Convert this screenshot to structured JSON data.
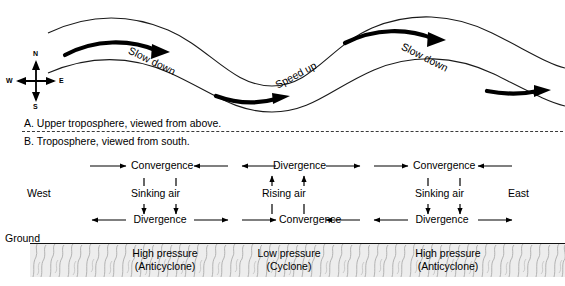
{
  "figure": {
    "panel_a": {
      "caption": "A. Upper troposphere, viewed from above.",
      "compass": {
        "north": "N",
        "south": "S",
        "west": "W",
        "east": "E"
      },
      "wave_labels": [
        {
          "text": "Slow down"
        },
        {
          "text": "Speed up"
        },
        {
          "text": "Slow down"
        }
      ]
    },
    "panel_b": {
      "caption": "B. Troposphere, viewed from south.",
      "west_label": "West",
      "east_label": "East",
      "ground_label": "Ground",
      "upper_row": [
        {
          "text": "Convergence"
        },
        {
          "text": "Divergence"
        },
        {
          "text": "Convergence"
        }
      ],
      "middle_row": [
        {
          "text": "Sinking air"
        },
        {
          "text": "Rising air"
        },
        {
          "text": "Sinking air"
        }
      ],
      "lower_row": [
        {
          "text": "Divergence"
        },
        {
          "text": "Convergence"
        },
        {
          "text": "Divergence"
        }
      ],
      "pressure_cells": [
        {
          "line1": "High pressure",
          "line2": "(Anticyclone)"
        },
        {
          "line1": "Low pressure",
          "line2": "(Cyclone)"
        },
        {
          "line1": "High pressure",
          "line2": "(Anticyclone)"
        }
      ]
    }
  },
  "colors": {
    "ink": "#000000",
    "line": "#1a1a1a",
    "ground": "#b9b9b9",
    "dashed": "#3a3a3a"
  }
}
